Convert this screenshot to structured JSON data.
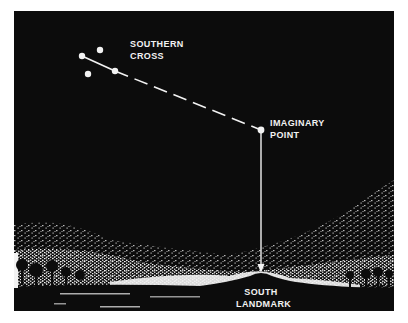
{
  "diagram": {
    "labels": {
      "southern_cross": [
        "SOUTHERN",
        "CROSS"
      ],
      "imaginary_point": [
        "IMAGINARY",
        "POINT"
      ],
      "south_landmark": [
        "SOUTH",
        "LANDMARK"
      ]
    },
    "stars": [
      {
        "name": "star-1",
        "x": 82,
        "y": 56
      },
      {
        "name": "star-2",
        "x": 100,
        "y": 50
      },
      {
        "name": "star-3",
        "x": 88,
        "y": 74
      },
      {
        "name": "star-4",
        "x": 115,
        "y": 71
      }
    ],
    "imaginary_point": {
      "x": 261,
      "y": 130
    },
    "arrow_tip": {
      "x": 261,
      "y": 272
    },
    "colors": {
      "sky": "#0c0c0c",
      "foreground": "#f2f2f2"
    }
  }
}
